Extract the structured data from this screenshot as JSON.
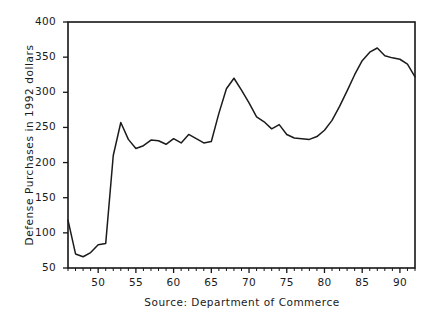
{
  "chart_data": {
    "type": "line",
    "title": "",
    "xlabel": "",
    "ylabel": "Defense Purchases in 1992 dollars",
    "caption": "Source: Department of Commerce",
    "xlim": [
      1946,
      1992
    ],
    "ylim": [
      50,
      400
    ],
    "grid": false,
    "legend": null,
    "x_tick_labels": [
      "50",
      "55",
      "60",
      "65",
      "70",
      "75",
      "80",
      "85",
      "90"
    ],
    "x_tick_values": [
      1950,
      1955,
      1960,
      1965,
      1970,
      1975,
      1980,
      1985,
      1990
    ],
    "x_minor_tick_step": 1,
    "y_tick_labels": [
      "50",
      "100",
      "150",
      "200",
      "250",
      "300",
      "350",
      "400"
    ],
    "y_tick_values": [
      50,
      100,
      150,
      200,
      250,
      300,
      350,
      400
    ],
    "series": [
      {
        "name": "Defense Purchases",
        "color": "#1b1b1b",
        "x": [
          1946,
          1947,
          1948,
          1949,
          1950,
          1951,
          1952,
          1953,
          1954,
          1955,
          1956,
          1957,
          1958,
          1959,
          1960,
          1961,
          1962,
          1963,
          1964,
          1965,
          1966,
          1967,
          1968,
          1969,
          1970,
          1971,
          1972,
          1973,
          1974,
          1975,
          1976,
          1977,
          1978,
          1979,
          1980,
          1981,
          1982,
          1983,
          1984,
          1985,
          1986,
          1987,
          1988,
          1989,
          1990,
          1991,
          1992
        ],
        "y": [
          118,
          70,
          66,
          72,
          83,
          85,
          210,
          257,
          233,
          220,
          224,
          232,
          231,
          226,
          234,
          228,
          240,
          234,
          228,
          230,
          270,
          305,
          320,
          303,
          285,
          265,
          258,
          248,
          254,
          240,
          235,
          234,
          233,
          237,
          246,
          260,
          280,
          302,
          325,
          345,
          357,
          363,
          352,
          349,
          347,
          340,
          322
        ]
      }
    ]
  },
  "axis": {
    "y_title": "Defense Purchases in 1992 dollars"
  },
  "footer": {
    "source": "Source: Department of Commerce"
  }
}
